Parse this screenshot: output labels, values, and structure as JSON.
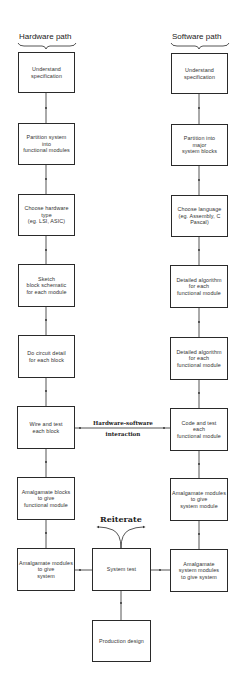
{
  "headers": {
    "hardware": "Hardware path",
    "software": "Software path"
  },
  "hardware_path": [
    {
      "label": "Understand\nspecification"
    },
    {
      "label": "Partition system\ninto\nfunctional modules"
    },
    {
      "label": "Choose hardware\ntype\n(eg. LSI, ASIC)"
    },
    {
      "label": "Sketch\nblock schematic\nfor each module"
    },
    {
      "label": "Do circuit detail\nfor each block"
    },
    {
      "label": "Wire and test\neach block"
    },
    {
      "label": "Amalgamate blocks\nto give\nfunctional module"
    },
    {
      "label": "Amalgamate modules\nto give\nsystem"
    }
  ],
  "software_path": [
    {
      "label": "Understand\nspecification"
    },
    {
      "label": "Partition into\nmajor\nsystem blocks"
    },
    {
      "label": "Choose language\n(eg. Assembly, C\nPascal)"
    },
    {
      "label": "Detailed algorithm\nfor each\nfunctional module"
    },
    {
      "label": "Detailed algorithm\nfor each\nfunctional module"
    },
    {
      "label": "Code and test\neach\nfunctional module"
    },
    {
      "label": "Amalgamate modules\nto give\nsystem module"
    },
    {
      "label": "Amalgamate\nsystem modules\nto give system"
    }
  ],
  "center": {
    "system_test": "System test",
    "production_design": "Production design",
    "reiterate": "Reiterate",
    "interaction_line1": "Hardware-software",
    "interaction_line2": "interaction"
  },
  "colors": {
    "line": "#2a2a2a",
    "background": "#ffffff"
  }
}
